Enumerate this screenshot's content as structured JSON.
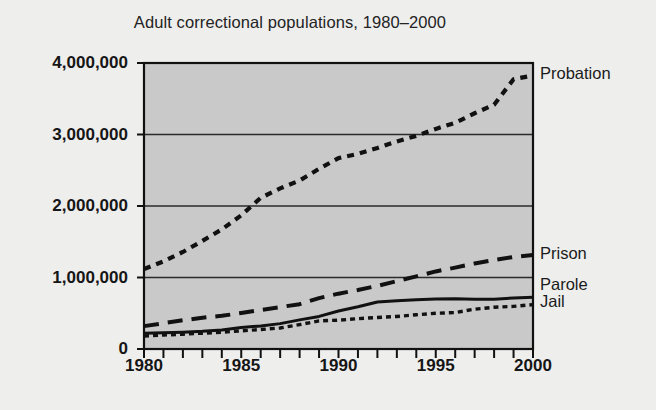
{
  "chart_data": {
    "type": "line",
    "title": "Adult correctional populations, 1980–2000",
    "xlabel": "",
    "ylabel": "",
    "xlim": [
      1980,
      2000
    ],
    "ylim": [
      0,
      4000000
    ],
    "grid": true,
    "legend_position": "right-of-plot-at-line-end",
    "y_ticks": [
      {
        "value": 0,
        "label": "0"
      },
      {
        "value": 1000000,
        "label": "1,000,000"
      },
      {
        "value": 2000000,
        "label": "2,000,000"
      },
      {
        "value": 3000000,
        "label": "3,000,000"
      },
      {
        "value": 4000000,
        "label": "4,000,000"
      }
    ],
    "x_ticks": [
      {
        "value": 1980,
        "label": "1980"
      },
      {
        "value": 1985,
        "label": "1985"
      },
      {
        "value": 1990,
        "label": "1990"
      },
      {
        "value": 1995,
        "label": "1995"
      },
      {
        "value": 2000,
        "label": "2000"
      }
    ],
    "x_minor_ticks_every": 1,
    "x": [
      1980,
      1981,
      1982,
      1983,
      1984,
      1985,
      1986,
      1987,
      1988,
      1989,
      1990,
      1991,
      1992,
      1993,
      1994,
      1995,
      1996,
      1997,
      1998,
      1999,
      2000
    ],
    "series": [
      {
        "name": "Probation",
        "label": "Probation",
        "style": "dotted",
        "color": "#111111",
        "values": [
          1118000,
          1225000,
          1357000,
          1512000,
          1673000,
          1870000,
          2114000,
          2247000,
          2356000,
          2520000,
          2670000,
          2729000,
          2811000,
          2903000,
          2981000,
          3078000,
          3164000,
          3297000,
          3417000,
          3773000,
          3826000
        ]
      },
      {
        "name": "Prison",
        "label": "Prison",
        "style": "dashed",
        "color": "#111111",
        "values": [
          320000,
          360000,
          402000,
          437000,
          464000,
          503000,
          545000,
          586000,
          627000,
          712000,
          774000,
          825000,
          883000,
          949000,
          1016000,
          1085000,
          1138000,
          1197000,
          1245000,
          1287000,
          1316000
        ]
      },
      {
        "name": "Parole",
        "label": "Parole",
        "style": "solid",
        "color": "#111111",
        "values": [
          220000,
          226000,
          235000,
          247000,
          266000,
          300000,
          323000,
          355000,
          407000,
          456000,
          531000,
          590000,
          658000,
          676000,
          690000,
          700000,
          704000,
          695000,
          696000,
          714000,
          725000
        ]
      },
      {
        "name": "Jail",
        "label": "Jail",
        "style": "fine-dotted",
        "color": "#111111",
        "values": [
          182000,
          196000,
          207000,
          221000,
          234000,
          254000,
          272000,
          294000,
          341000,
          393000,
          403000,
          424000,
          441000,
          455000,
          479000,
          499000,
          510000,
          557000,
          584000,
          596000,
          621000
        ]
      }
    ],
    "label_anchors": [
      {
        "name": "Probation",
        "y_value": 3826000
      },
      {
        "name": "Prison",
        "y_value": 1316000
      },
      {
        "name": "Parole",
        "y_value": 880000
      },
      {
        "name": "Jail",
        "y_value": 640000
      }
    ],
    "colors": {
      "page_background": "#eeeeed",
      "plot_background": "#c9c9c9",
      "axis": "#111111",
      "gridline": "#2a2a2a",
      "text": "#161616"
    }
  }
}
